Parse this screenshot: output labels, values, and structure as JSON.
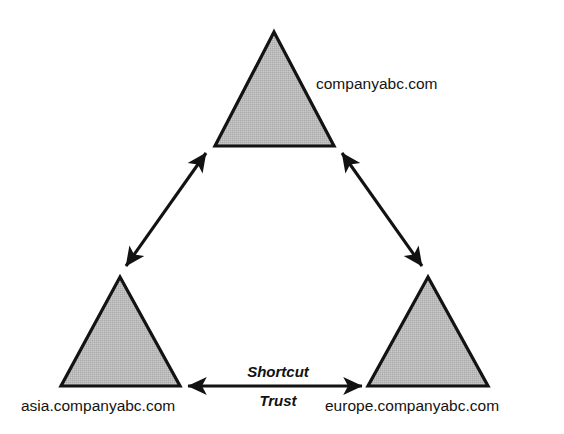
{
  "diagram": {
    "colors": {
      "domain_fill": "#b9b9b9",
      "domain_stroke": "#131313",
      "arrow": "#121212",
      "background": "#ffffff",
      "text": "#141414"
    },
    "nodes": [
      {
        "id": "root-domain",
        "label": "companyabc.com",
        "shape": "triangle",
        "apex": [
          274,
          32
        ],
        "base_left": [
          215,
          146
        ],
        "base_right": [
          334,
          146
        ],
        "label_x": 316,
        "label_y": 89,
        "label_anchor": "start"
      },
      {
        "id": "asia-domain",
        "label": "asia.companyabc.com",
        "shape": "triangle",
        "apex": [
          120,
          277
        ],
        "base_left": [
          61,
          386
        ],
        "base_right": [
          180,
          386
        ],
        "label_x": 21,
        "label_y": 411,
        "label_anchor": "start"
      },
      {
        "id": "europe-domain",
        "label": "europe.companyabc.com",
        "shape": "triangle",
        "apex": [
          428,
          277
        ],
        "base_left": [
          368,
          386
        ],
        "base_right": [
          488,
          386
        ],
        "label_x": 325,
        "label_y": 411,
        "label_anchor": "start"
      }
    ],
    "connections": [
      {
        "id": "asia-to-root-trust",
        "from": "asia-domain",
        "to": "root-domain",
        "arrow": "double",
        "x1": 126,
        "y1": 266,
        "x2": 206,
        "y2": 153,
        "label": ""
      },
      {
        "id": "europe-to-root-trust",
        "from": "europe-domain",
        "to": "root-domain",
        "arrow": "double",
        "x1": 422,
        "y1": 266,
        "x2": 342,
        "y2": 153,
        "label": ""
      },
      {
        "id": "shortcut-trust",
        "from": "asia-domain",
        "to": "europe-domain",
        "arrow": "double",
        "x1": 186,
        "y1": 386,
        "x2": 363,
        "y2": 386,
        "label_line_1": "Shortcut",
        "label_line_2": "Trust"
      }
    ],
    "labels": {
      "shortcut": "Shortcut",
      "trust": "Trust",
      "shortcut_x": 278,
      "shortcut_y": 377,
      "trust_x": 278,
      "trust_y": 406
    }
  }
}
